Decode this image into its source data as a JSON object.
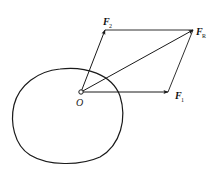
{
  "diagram": {
    "type": "force-parallelogram",
    "stroke_color": "#1a1a1a",
    "origin": {
      "label": "O",
      "x": 81,
      "y": 92
    },
    "vectors": [
      {
        "id": "F1",
        "label": "F",
        "subscript": "1",
        "from": [
          81,
          92
        ],
        "to": [
          168,
          92
        ]
      },
      {
        "id": "F2",
        "label": "F",
        "subscript": "2",
        "from": [
          81,
          92
        ],
        "to": [
          105,
          30
        ]
      },
      {
        "id": "FR",
        "label": "F",
        "subscript": "R",
        "from": [
          81,
          92
        ],
        "to": [
          193,
          30
        ]
      }
    ],
    "parallelogram_edges": [
      {
        "from": [
          105,
          30
        ],
        "to": [
          193,
          30
        ]
      },
      {
        "from": [
          168,
          92
        ],
        "to": [
          193,
          30
        ]
      }
    ],
    "body": {
      "shape": "closed-curve",
      "bounds": {
        "left": 12,
        "right": 123,
        "top": 68,
        "bottom": 164
      }
    }
  },
  "labels": {
    "origin": "O",
    "f1_main": "F",
    "f1_sub": "1",
    "f2_main": "F",
    "f2_sub": "2",
    "fr_main": "F",
    "fr_sub": "R"
  }
}
